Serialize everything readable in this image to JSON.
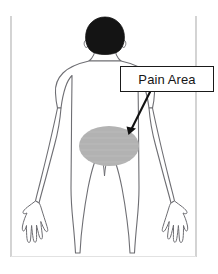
{
  "diagram": {
    "type": "body-pain-location-diagram",
    "view": "posterior",
    "background_color": "#ffffff",
    "frame": {
      "left_rule_x": 11,
      "right_rule_x": 196,
      "rule_color": "#b0b0b0",
      "baseline_color": "#dcdcdc"
    },
    "annotation": {
      "label": "Pain Area",
      "box_fill": "#ffffff",
      "box_border_color": "#1a1a1a",
      "text_color": "#161616",
      "leader_arrow_color": "#111111"
    },
    "pain_region": {
      "shape": "ellipse",
      "fill_color": "#b3b3b3",
      "center_x": 109,
      "center_y": 146,
      "radius_x": 30,
      "radius_y": 20,
      "body_location": "lower-back"
    },
    "body": {
      "outline_color": "#6e6e73",
      "outline_fill": "#ffffff",
      "hair_color": "#141414",
      "head_center_x": 105,
      "head_top_y": 18
    }
  }
}
